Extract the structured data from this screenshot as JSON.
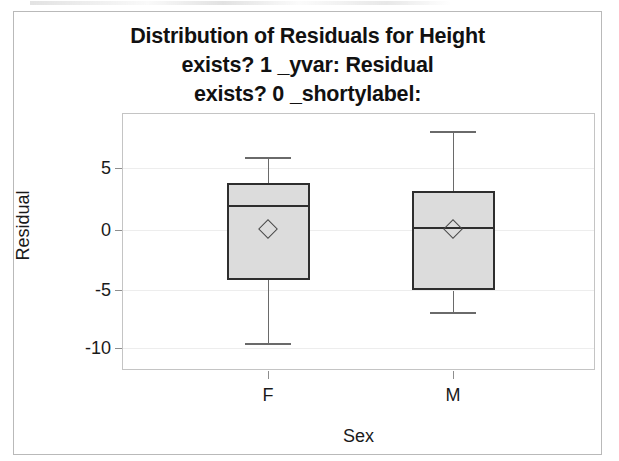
{
  "chart_data": {
    "type": "box",
    "title_lines": [
      "Distribution of Residuals for Height",
      "exists? 1 _yvar: Residual",
      "exists? 0 _shortylabel:"
    ],
    "xlabel": "Sex",
    "ylabel": "Residual",
    "categories": [
      "F",
      "M"
    ],
    "ylim": [
      -11.3,
      9.7
    ],
    "yticks": [
      5,
      0,
      -5,
      -10
    ],
    "ytick_labels": [
      "5",
      "0",
      "-5",
      "-10"
    ],
    "grid": true,
    "legend": "none",
    "boxes": [
      {
        "category": "F",
        "whisker_high": 6.0,
        "q3": 3.9,
        "median": 2.05,
        "q1": -4.1,
        "whisker_low": -9.3,
        "mean": 0.1
      },
      {
        "category": "M",
        "whisker_high": 8.2,
        "q3": 3.2,
        "median": 0.25,
        "q1": -5.0,
        "whisker_low": -6.8,
        "mean": 0.05
      }
    ],
    "colors": {
      "box_fill": "#dcdcdc",
      "box_edge": "#2e2e2e",
      "whisker": "#6a6a6a",
      "grid": "#ededed",
      "frame": "#c4c4c4",
      "text": "#1a1a1a"
    }
  }
}
